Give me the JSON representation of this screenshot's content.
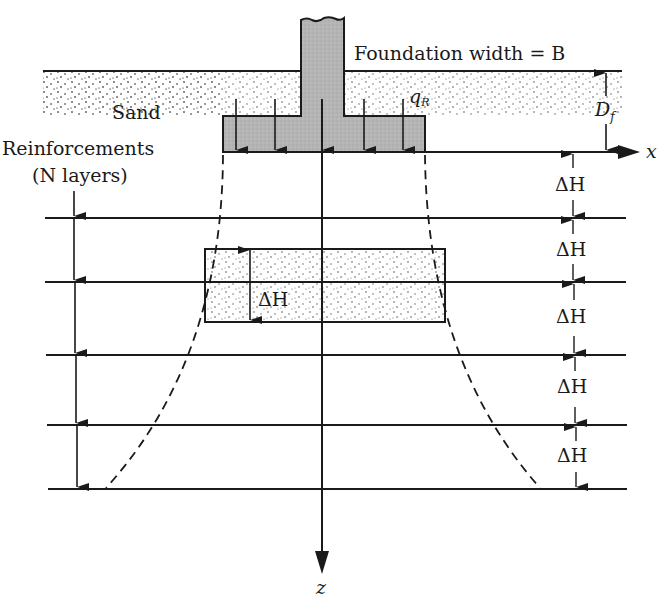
{
  "figure": {
    "labels": {
      "foundation_width": "Foundation width = B",
      "sand": "Sand",
      "q_r": "q",
      "q_r_sub": "R",
      "d_f": "D",
      "d_f_sub": "f",
      "reinforcements_line1": "Reinforcements",
      "reinforcements_line2": "(N layers)",
      "x_axis": "x",
      "z_axis": "z",
      "delta_h": "ΔH"
    },
    "colors": {
      "line": "#1a1a1a",
      "footing_fill": "#b4b4b4",
      "sand_dots": "#555555",
      "background": "#ffffff"
    },
    "reinforcement_layers": [
      218,
      282,
      354,
      424,
      488
    ],
    "spacing_labels": [
      "ΔH",
      "ΔH",
      "ΔH",
      "ΔH",
      "ΔH"
    ]
  }
}
